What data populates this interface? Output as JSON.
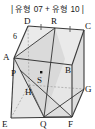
{
  "header": {
    "title": "| 유형 07 + 유형 10 |"
  },
  "figure": {
    "name": "cube-with-cross-section-diagram",
    "type": "geometry-solid",
    "solid": "rectangular-prism",
    "colors": {
      "stroke": "#3a3a3a",
      "hidden_stroke": "#9a9a9a",
      "face_fill": "#e8e8e8",
      "shaded_fill": "#d2d2d2",
      "label_color": "#111111",
      "background": "#ffffff"
    },
    "vertices": [
      {
        "id": "A",
        "label": "A",
        "x": 14,
        "y": 40
      },
      {
        "id": "B",
        "label": "B",
        "x": 72,
        "y": 47
      },
      {
        "id": "C",
        "label": "C",
        "x": 84,
        "y": 12
      },
      {
        "id": "D",
        "label": "D",
        "x": 28,
        "y": 8
      },
      {
        "id": "E",
        "label": "E",
        "x": 11,
        "y": 100
      },
      {
        "id": "F",
        "label": "F",
        "x": 72,
        "y": 99
      },
      {
        "id": "G",
        "label": "G",
        "x": 84,
        "y": 71
      },
      {
        "id": "H",
        "label": "H",
        "x": 29,
        "y": 67
      }
    ],
    "points": [
      {
        "id": "P",
        "label": "P",
        "x": 22,
        "y": 57
      },
      {
        "id": "Q",
        "label": "Q",
        "x": 44,
        "y": 99
      },
      {
        "id": "R",
        "label": "R",
        "x": 55,
        "y": 10
      },
      {
        "id": "S",
        "label": "S",
        "x": 41,
        "y": 62,
        "marker": true
      }
    ],
    "measures": [
      {
        "id": "edge-AD",
        "label": "6",
        "x": 15,
        "y": 23
      }
    ],
    "tick_marks": [
      {
        "id": "tick-DR",
        "segment": "D-R",
        "count": 1
      },
      {
        "id": "tick-RC",
        "segment": "R-C",
        "count": 1
      }
    ],
    "segments": [
      {
        "id": "seg-A-R",
        "from": "A",
        "to": "R",
        "style": "solid"
      },
      {
        "id": "seg-R-Q",
        "from": "R",
        "to": "Q",
        "style": "solid"
      },
      {
        "id": "seg-A-Q",
        "from": "A",
        "to": "Q",
        "style": "solid"
      },
      {
        "id": "seg-P-F",
        "from": "P",
        "to": "F",
        "style": "solid"
      },
      {
        "id": "seg-H-Q",
        "from": "H",
        "to": "Q",
        "style": "solid"
      },
      {
        "id": "seg-Q-G",
        "from": "Q",
        "to": "G",
        "style": "solid"
      },
      {
        "id": "seg-E-H",
        "from": "E",
        "to": "H",
        "style": "hidden"
      },
      {
        "id": "seg-H-G",
        "from": "H",
        "to": "G",
        "style": "hidden"
      },
      {
        "id": "seg-D-H",
        "from": "D",
        "to": "H",
        "style": "hidden"
      }
    ]
  }
}
